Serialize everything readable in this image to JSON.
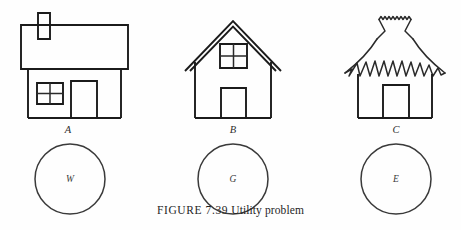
{
  "figure": {
    "caption_label": "FIGURE 7.39",
    "caption_text": "Utility problem",
    "background_color": "#fefefe",
    "ink_color": "#1b1b1b"
  },
  "houses": [
    {
      "id": "house-a",
      "label": "A",
      "roof_style": "flat-rectangular-roof-with-chimney",
      "features": [
        "chimney",
        "window-with-cross-mullions",
        "door"
      ]
    },
    {
      "id": "house-b",
      "label": "B",
      "roof_style": "peaked-gable-double-line",
      "features": [
        "window-with-cross-mullions",
        "door"
      ]
    },
    {
      "id": "house-c",
      "label": "C",
      "roof_style": "thatched-zigzag-hut-roof",
      "features": [
        "door"
      ]
    }
  ],
  "utilities": [
    {
      "id": "utility-w",
      "label": "W"
    },
    {
      "id": "utility-g",
      "label": "G"
    },
    {
      "id": "utility-e",
      "label": "E"
    }
  ]
}
